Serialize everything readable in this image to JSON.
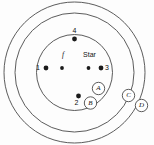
{
  "figure": {
    "background_color": "#fdfdfd",
    "line_color": "#4a4a4a",
    "dot_color": "#1b1b1b"
  },
  "rings": [
    {
      "name": "outer-ring",
      "cx": 74.5,
      "cy": 72.5,
      "r": 70.5
    },
    {
      "name": "middle-ring",
      "cx": 74.5,
      "cy": 72.5,
      "r": 59.5
    },
    {
      "name": "inner-ring",
      "cx": 74.5,
      "cy": 72.5,
      "r": 38.0
    }
  ],
  "dots": [
    {
      "name": "dot-1",
      "cx": 46,
      "cy": 68,
      "r": 2.4
    },
    {
      "name": "dot-f",
      "cx": 62,
      "cy": 68,
      "r": 1.9
    },
    {
      "name": "dot-star",
      "cx": 88.5,
      "cy": 68,
      "r": 1.9
    },
    {
      "name": "dot-3",
      "cx": 101,
      "cy": 68,
      "r": 2.4
    },
    {
      "name": "dot-4",
      "cx": 74.5,
      "cy": 39,
      "r": 2.4
    },
    {
      "name": "dot-2",
      "cx": 78.5,
      "cy": 96,
      "r": 2.4
    }
  ],
  "point_labels": [
    {
      "name": "label-1",
      "text": "1",
      "x": 38,
      "y": 68,
      "anchor": "middle"
    },
    {
      "name": "label-3",
      "text": "3",
      "x": 107,
      "y": 68,
      "anchor": "middle"
    },
    {
      "name": "label-4",
      "text": "4",
      "x": 74.5,
      "y": 31,
      "anchor": "middle"
    },
    {
      "name": "label-2",
      "text": "2",
      "x": 76.5,
      "y": 103,
      "anchor": "middle"
    }
  ],
  "inner_labels": [
    {
      "name": "label-f",
      "text": "f",
      "x": 63,
      "y": 55,
      "style": "italic"
    },
    {
      "name": "label-star",
      "text": "Star",
      "x": 89.5,
      "y": 55,
      "style": "plain"
    }
  ],
  "nodes": [
    {
      "name": "node-a",
      "label": "A",
      "cx": 98.5,
      "cy": 88.5,
      "r": 6.2
    },
    {
      "name": "node-b",
      "label": "B",
      "cx": 90.5,
      "cy": 103,
      "r": 6.2
    },
    {
      "name": "node-c",
      "label": "C",
      "cx": 128.5,
      "cy": 95.5,
      "r": 6.2
    },
    {
      "name": "node-d",
      "label": "D",
      "cx": 141.5,
      "cy": 105.5,
      "r": 6.2
    }
  ]
}
